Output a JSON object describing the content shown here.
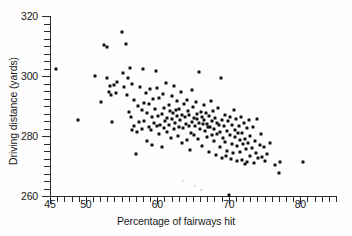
{
  "chart_data": {
    "type": "scatter",
    "title": "",
    "xlabel": "Percentage of fairways hit",
    "ylabel": "Driving distance (yards)",
    "xlim": [
      45,
      85
    ],
    "ylim": [
      260,
      320
    ],
    "grid": false,
    "legend": null,
    "x_major_ticks": [
      45,
      50,
      60,
      70,
      80
    ],
    "x_tick_labels": [
      "45",
      "50",
      "60",
      "70",
      "80"
    ],
    "x_minor_tick_step": 1,
    "y_major_ticks": [
      260,
      280,
      300,
      320
    ],
    "y_tick_labels": [
      "260",
      "280",
      "300",
      "320"
    ],
    "y_minor_tick_step": 2.5,
    "marker": "square-dot",
    "marker_color": "#111111",
    "point_count": 196,
    "points": [
      [
        45.9,
        302.2
      ],
      [
        48.9,
        285.4
      ],
      [
        51.3,
        300.0
      ],
      [
        52.1,
        291.2
      ],
      [
        52.6,
        310.5
      ],
      [
        52.9,
        309.6
      ],
      [
        53.0,
        299.4
      ],
      [
        53.2,
        294.6
      ],
      [
        53.4,
        296.6
      ],
      [
        53.5,
        293.8
      ],
      [
        53.6,
        284.6
      ],
      [
        54.0,
        297.0
      ],
      [
        54.2,
        294.4
      ],
      [
        54.4,
        298.1
      ],
      [
        55.1,
        314.8
      ],
      [
        55.2,
        301.0
      ],
      [
        55.4,
        296.2
      ],
      [
        55.6,
        310.6
      ],
      [
        55.8,
        293.8
      ],
      [
        55.9,
        299.3
      ],
      [
        56.1,
        288.0
      ],
      [
        56.2,
        302.8
      ],
      [
        56.3,
        286.3
      ],
      [
        56.4,
        282.0
      ],
      [
        56.5,
        297.5
      ],
      [
        56.7,
        292.1
      ],
      [
        56.8,
        283.4
      ],
      [
        57.0,
        274.0
      ],
      [
        57.2,
        281.5
      ],
      [
        57.3,
        290.0
      ],
      [
        57.4,
        284.7
      ],
      [
        57.6,
        296.5
      ],
      [
        57.8,
        288.8
      ],
      [
        57.9,
        282.2
      ],
      [
        58.0,
        302.4
      ],
      [
        58.1,
        291.0
      ],
      [
        58.2,
        285.0
      ],
      [
        58.4,
        294.3
      ],
      [
        58.5,
        287.6
      ],
      [
        58.6,
        278.2
      ],
      [
        58.8,
        283.0
      ],
      [
        58.9,
        290.6
      ],
      [
        59.0,
        295.8
      ],
      [
        59.1,
        281.9
      ],
      [
        59.2,
        286.4
      ],
      [
        59.3,
        277.0
      ],
      [
        59.4,
        292.4
      ],
      [
        59.6,
        284.2
      ],
      [
        59.7,
        288.9
      ],
      [
        59.8,
        301.6
      ],
      [
        59.9,
        283.3
      ],
      [
        60.0,
        296.0
      ],
      [
        60.1,
        286.8
      ],
      [
        60.2,
        280.6
      ],
      [
        60.3,
        292.8
      ],
      [
        60.4,
        283.8
      ],
      [
        60.6,
        287.2
      ],
      [
        60.7,
        276.4
      ],
      [
        60.8,
        294.0
      ],
      [
        60.9,
        282.6
      ],
      [
        61.0,
        289.4
      ],
      [
        61.1,
        285.1
      ],
      [
        61.2,
        297.8
      ],
      [
        61.3,
        281.2
      ],
      [
        61.4,
        286.0
      ],
      [
        61.6,
        290.2
      ],
      [
        61.7,
        283.6
      ],
      [
        61.8,
        288.2
      ],
      [
        61.9,
        279.4
      ],
      [
        62.0,
        293.2
      ],
      [
        62.1,
        285.8
      ],
      [
        62.2,
        287.8
      ],
      [
        62.3,
        282.4
      ],
      [
        62.4,
        296.8
      ],
      [
        62.5,
        284.4
      ],
      [
        62.6,
        288.6
      ],
      [
        62.7,
        291.6
      ],
      [
        62.8,
        286.6
      ],
      [
        62.9,
        280.0
      ],
      [
        63.0,
        289.0
      ],
      [
        63.1,
        283.0
      ],
      [
        63.2,
        285.4
      ],
      [
        63.3,
        294.8
      ],
      [
        63.4,
        287.0
      ],
      [
        63.5,
        277.6
      ],
      [
        63.6,
        282.8
      ],
      [
        63.8,
        290.8
      ],
      [
        63.9,
        286.2
      ],
      [
        64.0,
        284.0
      ],
      [
        64.1,
        292.0
      ],
      [
        64.2,
        278.8
      ],
      [
        64.3,
        288.4
      ],
      [
        64.4,
        283.2
      ],
      [
        64.5,
        286.9
      ],
      [
        64.6,
        275.2
      ],
      [
        64.7,
        281.0
      ],
      [
        64.8,
        295.2
      ],
      [
        64.9,
        284.8
      ],
      [
        65.0,
        289.6
      ],
      [
        65.1,
        286.1
      ],
      [
        65.2,
        280.4
      ],
      [
        65.3,
        283.5
      ],
      [
        65.4,
        291.4
      ],
      [
        65.5,
        285.6
      ],
      [
        65.6,
        287.4
      ],
      [
        65.7,
        279.0
      ],
      [
        65.8,
        284.3
      ],
      [
        65.9,
        301.2
      ],
      [
        66.0,
        282.2
      ],
      [
        66.1,
        288.1
      ],
      [
        66.2,
        286.5
      ],
      [
        66.3,
        276.8
      ],
      [
        66.4,
        283.9
      ],
      [
        66.5,
        290.4
      ],
      [
        66.6,
        285.2
      ],
      [
        66.7,
        281.6
      ],
      [
        66.8,
        287.6
      ],
      [
        66.9,
        284.1
      ],
      [
        67.0,
        279.6
      ],
      [
        67.1,
        282.9
      ],
      [
        67.2,
        286.7
      ],
      [
        67.3,
        274.6
      ],
      [
        67.4,
        283.1
      ],
      [
        67.5,
        291.8
      ],
      [
        67.6,
        280.2
      ],
      [
        67.7,
        285.0
      ],
      [
        67.8,
        288.3
      ],
      [
        67.9,
        278.4
      ],
      [
        68.0,
        282.5
      ],
      [
        68.1,
        286.0
      ],
      [
        68.2,
        273.8
      ],
      [
        68.3,
        284.5
      ],
      [
        68.4,
        280.8
      ],
      [
        68.5,
        289.2
      ],
      [
        68.6,
        283.7
      ],
      [
        68.7,
        276.2
      ],
      [
        68.8,
        281.4
      ],
      [
        68.9,
        299.2
      ],
      [
        69.0,
        285.5
      ],
      [
        69.1,
        272.6
      ],
      [
        69.2,
        279.2
      ],
      [
        69.3,
        283.4
      ],
      [
        69.4,
        287.1
      ],
      [
        69.5,
        278.0
      ],
      [
        69.6,
        273.2
      ],
      [
        69.7,
        281.8
      ],
      [
        69.8,
        275.0
      ],
      [
        69.9,
        284.9
      ],
      [
        70.0,
        260.4
      ],
      [
        70.1,
        280.3
      ],
      [
        70.2,
        286.3
      ],
      [
        70.3,
        272.4
      ],
      [
        70.4,
        277.2
      ],
      [
        70.5,
        283.8
      ],
      [
        70.6,
        274.4
      ],
      [
        70.7,
        288.7
      ],
      [
        70.8,
        279.8
      ],
      [
        70.9,
        282.1
      ],
      [
        71.0,
        285.7
      ],
      [
        71.1,
        271.8
      ],
      [
        71.2,
        276.6
      ],
      [
        71.3,
        280.9
      ],
      [
        71.4,
        283.3
      ],
      [
        71.5,
        274.8
      ],
      [
        71.6,
        278.6
      ],
      [
        71.7,
        286.2
      ],
      [
        71.8,
        272.0
      ],
      [
        71.9,
        281.1
      ],
      [
        72.0,
        277.4
      ],
      [
        72.1,
        284.2
      ],
      [
        72.2,
        270.6
      ],
      [
        72.3,
        279.0
      ],
      [
        72.4,
        275.6
      ],
      [
        72.5,
        282.7
      ],
      [
        72.6,
        271.2
      ],
      [
        72.7,
        277.8
      ],
      [
        72.8,
        285.3
      ],
      [
        72.9,
        273.4
      ],
      [
        73.0,
        280.1
      ],
      [
        73.2,
        276.0
      ],
      [
        73.4,
        283.0
      ],
      [
        73.5,
        271.0
      ],
      [
        73.6,
        278.3
      ],
      [
        73.8,
        274.2
      ],
      [
        74.0,
        285.8
      ],
      [
        74.1,
        272.8
      ],
      [
        74.3,
        277.0
      ],
      [
        74.5,
        280.6
      ],
      [
        74.7,
        273.0
      ],
      [
        74.9,
        276.4
      ],
      [
        75.1,
        271.6
      ],
      [
        75.4,
        274.0
      ],
      [
        75.8,
        277.6
      ],
      [
        76.5,
        270.2
      ],
      [
        77.0,
        267.6
      ],
      [
        77.1,
        271.4
      ],
      [
        80.4,
        271.2
      ]
    ],
    "specks": [
      {
        "x": 63.6,
        "y": 265.0,
        "r": 1.2
      },
      {
        "x": 65.3,
        "y": 263.4,
        "r": 1.0
      },
      {
        "x": 66.1,
        "y": 262.0,
        "r": 0.9
      },
      {
        "x": 64.4,
        "y": 269.8,
        "r": 0.8
      }
    ]
  }
}
